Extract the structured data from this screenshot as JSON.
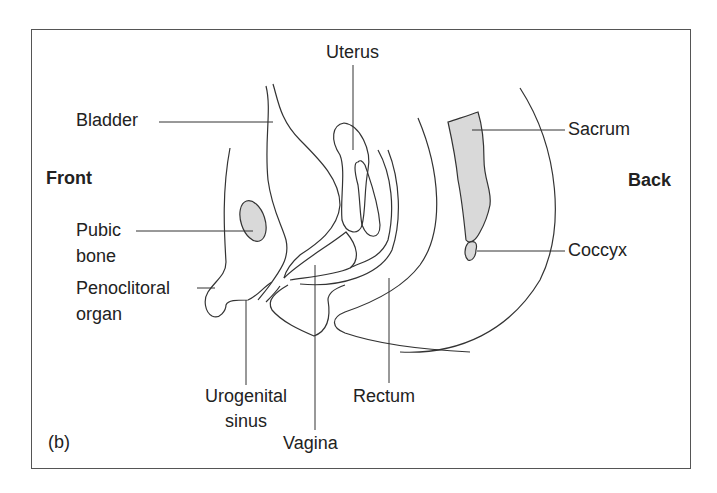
{
  "figure": {
    "panel_label": "(b)",
    "orientation": {
      "front": "Front",
      "back": "Back"
    },
    "labels": {
      "uterus": "Uterus",
      "bladder": "Bladder",
      "sacrum": "Sacrum",
      "pubic_bone_1": "Pubic",
      "pubic_bone_2": "bone",
      "coccyx": "Coccyx",
      "penoclitoral_1": "Penoclitoral",
      "penoclitoral_2": "organ",
      "urogenital_1": "Urogenital",
      "urogenital_2": "sinus",
      "rectum": "Rectum",
      "vagina": "Vagina"
    },
    "colors": {
      "line": "#333333",
      "bone_fill": "#d9d9d9",
      "border": "#555555"
    }
  }
}
